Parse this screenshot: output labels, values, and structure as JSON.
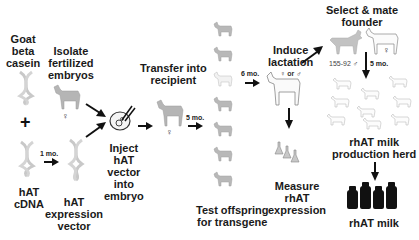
{
  "diagram": {
    "labels": {
      "goat_beta_casein": [
        "Goat",
        "beta",
        "casein"
      ],
      "plus": "+",
      "hat_cdna": [
        "hAT",
        "cDNA"
      ],
      "isolate_embryos": [
        "Isolate",
        "fertilized",
        "embryos"
      ],
      "hat_expression_vector": [
        "hAT",
        "expression",
        "vector"
      ],
      "inject": [
        "Inject",
        "hAT",
        "vector",
        "into",
        "embryo"
      ],
      "transfer": [
        "Transfer into",
        "recipient"
      ],
      "test_offspring": [
        "Test offspring",
        "for transgene"
      ],
      "induce_lactation": [
        "Induce",
        "lactation"
      ],
      "measure": [
        "Measure",
        "rhAT",
        "expression"
      ],
      "select_mate": [
        "Select & mate",
        "founder"
      ],
      "production_herd": [
        "rhAT milk",
        "production herd"
      ],
      "rhat_milk": "rhAT milk"
    },
    "durations": {
      "cdna_to_vector": "1 mo.",
      "recipient_to_offspring": "5 mo.",
      "offspring_to_lactation": "6 mo.",
      "founder_to_herd": "5 mo."
    },
    "sex_marks": {
      "female": "♀",
      "male": "♂",
      "lactation_sex": "♀ or ♂",
      "founder_id": "155-92 ♂"
    },
    "offspring_count": 7,
    "herd_count": 9,
    "bottle_count": 4,
    "colors": {
      "text": "#1a1a1a",
      "arrow": "#111111",
      "goat_fill": "#b5b5b5",
      "goat_outline": "#9a9a9a",
      "bottle": "#111111"
    }
  }
}
